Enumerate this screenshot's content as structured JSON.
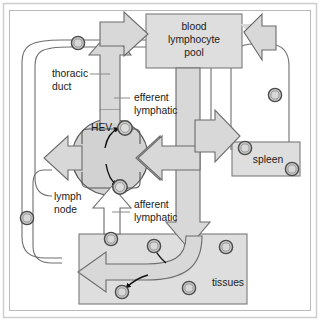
{
  "figure": {
    "border_color": "#cfcfcf",
    "background": "#ffffff"
  },
  "palette": {
    "arrow_fill": "#d8d8d8",
    "arrow_stroke": "#6b6b6b",
    "box_fill": "#dedede",
    "box_stroke": "#7a7a7a",
    "node_fill": "#d2d2d2",
    "node_stroke": "#555555",
    "cell_fill": "#c9c9c9",
    "cell_stroke": "#4a4a4a",
    "vessel_stroke": "#6b6b6b",
    "text_color": "#1a1a1a",
    "leader_color": "#8a8a8a"
  },
  "compartments": [
    {
      "id": "blood-lymphocyte-pool",
      "label": "blood\nlymphocyte\npool",
      "line1": "blood",
      "line2": "lymphocyte",
      "line3": "pool",
      "shape": "rectangle"
    },
    {
      "id": "spleen",
      "label": "spleen",
      "shape": "rectangle"
    },
    {
      "id": "tissues",
      "label": "tissues",
      "shape": "rectangle"
    },
    {
      "id": "lymph-node",
      "label": "lymph\nnode",
      "line1": "lymph",
      "line2": "node",
      "shape": "circle"
    }
  ],
  "labels": {
    "blood_pool_l1": "blood",
    "blood_pool_l2": "lymphocyte",
    "blood_pool_l3": "pool",
    "thoracic_duct_l1": "thoracic",
    "thoracic_duct_l2": "duct",
    "efferent_l1": "efferent",
    "efferent_l2": "lymphatic",
    "afferent_l1": "afferent",
    "afferent_l2": "lymphatic",
    "lymph_node_l1": "lymph",
    "lymph_node_l2": "node",
    "hev": "HEV",
    "spleen": "spleen",
    "tissues": "tissues"
  },
  "flows": [
    {
      "id": "thoracic-duct-to-blood",
      "from": "thoracic duct",
      "to": "blood lymphocyte pool",
      "direction": "up-right"
    },
    {
      "id": "blood-to-lymph-node",
      "from": "blood lymphocyte pool",
      "to": "lymph node",
      "direction": "left",
      "via": "HEV"
    },
    {
      "id": "lymph-node-to-efferent",
      "from": "lymph node",
      "to": "efferent lymphatic",
      "direction": "up"
    },
    {
      "id": "lymph-node-exit-left",
      "from": "lymph node",
      "to": "left lymphatic loop",
      "direction": "left"
    },
    {
      "id": "afferent-to-lymph-node",
      "from": "afferent lymphatic",
      "to": "lymph node",
      "direction": "up"
    },
    {
      "id": "blood-to-tissues",
      "from": "blood lymphocyte pool",
      "to": "tissues",
      "direction": "down"
    },
    {
      "id": "tissues-to-afferent",
      "from": "tissues",
      "to": "afferent lymphatic",
      "direction": "left"
    },
    {
      "id": "blood-to-spleen",
      "from": "blood lymphocyte pool",
      "to": "spleen",
      "direction": "right-down"
    },
    {
      "id": "spleen-to-blood",
      "from": "spleen",
      "to": "blood lymphocyte pool",
      "direction": "up-left"
    }
  ],
  "cells": {
    "count": 12,
    "description": "lymphocytes shown as small circles along vessels and inside compartments"
  }
}
